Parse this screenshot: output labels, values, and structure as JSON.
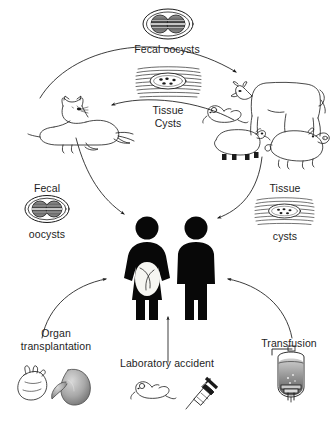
{
  "figure": {
    "background_color": "#ffffff",
    "ink_color": "#1a1a1a"
  },
  "labels": {
    "fecal_oocysts_top": "Fecal oocysts",
    "tissue_cysts_center": "Tissue\nCysts",
    "fecal_left": "Fecal",
    "oocysts_left": "oocysts",
    "tissue_right": "Tissue",
    "cysts_right": "cysts",
    "organ_transplantation": "Organ\ntransplantation",
    "laboratory_accident": "Laboratory accident",
    "transfusion": "Transfusion"
  },
  "icons": {
    "oocyst_top": "oocyst-icon",
    "tissue_cyst_center": "tissue-cyst-icon",
    "oocyst_left": "oocyst-icon",
    "tissue_cyst_right": "tissue-cyst-icon",
    "cat": "cat-icon",
    "cow": "cow-icon",
    "mouse_upper": "mouse-icon",
    "sheep": "sheep-icon",
    "pig": "pig-icon",
    "woman": "pregnant-woman-icon",
    "man": "man-icon",
    "heart": "heart-icon",
    "kidney": "kidney-icon",
    "mouse_lab": "mouse-icon",
    "syringe": "syringe-icon",
    "blood_bag": "blood-bag-icon"
  },
  "arrows": [
    {
      "name": "cat-to-fecal-oocysts",
      "from": "cat",
      "to": "cow",
      "label": "Fecal oocysts"
    },
    {
      "name": "livestock-to-cat",
      "from": "livestock",
      "to": "cat",
      "label": "Tissue Cysts"
    },
    {
      "name": "cat-to-humans",
      "from": "cat",
      "to": "humans",
      "label": "Fecal oocysts"
    },
    {
      "name": "livestock-to-humans",
      "from": "livestock",
      "to": "humans",
      "label": "Tissue cysts"
    },
    {
      "name": "organ-transplantation-to-humans",
      "from": "organ transplantation",
      "to": "humans",
      "label": "Organ transplantation"
    },
    {
      "name": "laboratory-accident-to-humans",
      "from": "laboratory accident",
      "to": "humans",
      "label": "Laboratory accident"
    },
    {
      "name": "transfusion-to-humans",
      "from": "transfusion",
      "to": "humans",
      "label": "Transfusion"
    }
  ]
}
